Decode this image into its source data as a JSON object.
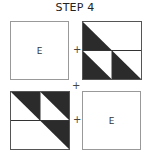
{
  "title": "STEP 4",
  "blocks": {
    "top_left": {
      "label": "E"
    },
    "bottom_right": {
      "label": "E"
    }
  },
  "operators": {
    "plus_top": "+",
    "plus_middle": "+",
    "plus_bottom": "+"
  },
  "colors": {
    "dark": "#2b2b2b",
    "outline": "#888888",
    "line": "#333333"
  }
}
